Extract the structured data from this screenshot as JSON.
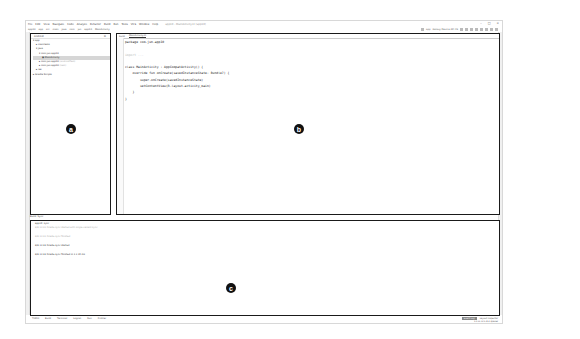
{
  "window": {
    "title": "app10 - MainActivity.kt [app10]",
    "menu": [
      "File",
      "Edit",
      "View",
      "Navigate",
      "Code",
      "Analyze",
      "Refactor",
      "Build",
      "Run",
      "Tools",
      "VCS",
      "Window",
      "Help"
    ],
    "breadcrumb": [
      "app10",
      "app",
      "src",
      "main",
      "java",
      "com",
      "jun",
      "app10",
      "MainActivity"
    ],
    "controls": [
      "–",
      "□",
      "×"
    ],
    "run_config": "app",
    "device": "Galaxy Device API 29"
  },
  "project_panel": {
    "view_selector": "Android",
    "tree": [
      {
        "label": "app",
        "indent": 0
      },
      {
        "label": "manifests",
        "indent": 1
      },
      {
        "label": "java",
        "indent": 1
      },
      {
        "label": "com.jun.app10",
        "indent": 2
      },
      {
        "label": "MainActivity",
        "indent": 3,
        "selected": true
      },
      {
        "label": "com.jun.app10",
        "suffix": "(androidTest)",
        "indent": 2
      },
      {
        "label": "com.jun.app10",
        "suffix": "(test)",
        "indent": 2
      },
      {
        "label": "res",
        "indent": 1
      },
      {
        "label": "Gradle Scripts",
        "indent": 0
      }
    ]
  },
  "editor": {
    "tabs": [
      "build",
      "MainActivity.kt"
    ],
    "code": [
      "package com.jun.app10",
      "",
      "import ...",
      "",
      "class MainActivity : AppCompatActivity() {",
      "    override fun onCreate(savedInstanceState: Bundle?) {",
      "        super.onCreate(savedInstanceState)",
      "        setContentView(R.layout.activity_main)",
      "    }",
      "}"
    ]
  },
  "build_panel": {
    "title": "Build: Sync",
    "lines": [
      {
        "text": "app10: sync",
        "dim": false
      },
      {
        "text": "8/8 11:31   Gradle sync started with single-variant sync",
        "dim": true
      },
      {
        "text": "8/8 11:31   Gradle sync finished",
        "dim": true
      },
      {
        "text": "8/8 11:32   Gradle sync started",
        "dim": false
      },
      {
        "text": "8/8 11:32   Gradle sync finished in 1 s 10 ms",
        "dim": false
      }
    ]
  },
  "bottom_tabs": [
    "TODO",
    "Build",
    "Terminal",
    "Logcat",
    "Run",
    "Profiler",
    "Event Log",
    "Layout Inspector"
  ],
  "status_bar": {
    "event_log": "Event Log",
    "layout_inspector": "Layout Inspector",
    "position": "1:1  LF  UTF-8  4 spaces"
  },
  "annotations": {
    "a": "a",
    "b": "b",
    "c": "c"
  }
}
